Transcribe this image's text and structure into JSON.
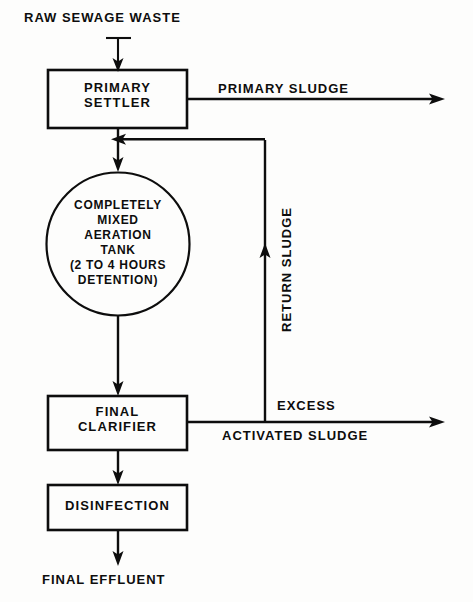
{
  "diagram": {
    "stroke_color": "#0d0d0d",
    "background_color": "#fdfdfc",
    "inlet": {
      "label": "RAW SEWAGE WASTE"
    },
    "nodes": [
      {
        "id": "primary-settler",
        "shape": "rectangle",
        "lines": [
          "PRIMARY",
          "SETTLER"
        ]
      },
      {
        "id": "aeration-tank",
        "shape": "circle",
        "lines": [
          "COMPLETELY",
          "MIXED",
          "AERATION",
          "TANK",
          "(2 TO 4 HOURS",
          "DETENTION)"
        ]
      },
      {
        "id": "final-clarifier",
        "shape": "rectangle",
        "lines": [
          "FINAL",
          "CLARIFIER"
        ]
      },
      {
        "id": "disinfection",
        "shape": "rectangle",
        "lines": [
          "DISINFECTION"
        ]
      }
    ],
    "edge_labels": {
      "primary_sludge": "PRIMARY SLUDGE",
      "return_sludge": "RETURN SLUDGE",
      "excess": "EXCESS",
      "activated_sludge": "ACTIVATED SLUDGE",
      "final_effluent": "FINAL EFFLUENT"
    }
  }
}
